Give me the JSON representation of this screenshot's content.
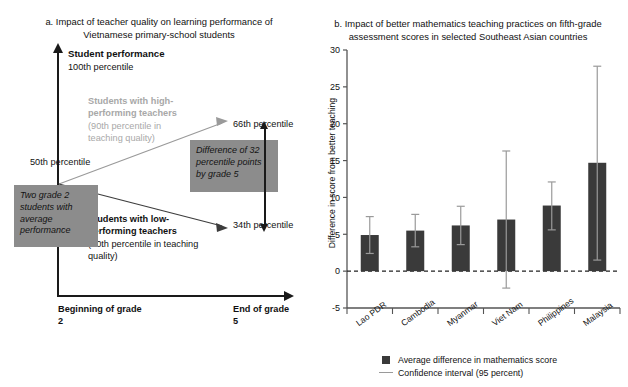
{
  "panel_a": {
    "title": "a. Impact of teacher quality on learning performance of Vietnamese primary-school students",
    "y_axis_title": "Student performance",
    "y_top_label": "100th percentile",
    "y_mid_label": "50th percentile",
    "high_label": "Students with high-performing teachers (90th percentile in teaching quality)",
    "high_label_bold": "Students with high-",
    "high_label_bold2": "performing teachers",
    "high_label_sub": "(90th percentile in teaching quality)",
    "low_label_bold": "Students with low-",
    "low_label_bold2": "performing teachers",
    "low_label_sub": "(10th percentile in teaching quality)",
    "end_high_label": "66th percentile",
    "end_low_label": "34th percentile",
    "x_start_label": "Beginning of grade 2",
    "x_end_label": "End of grade 5",
    "callout_difference": "Difference of 32 percentile points by grade 5",
    "callout_start": "Two grade 2 students with average performance",
    "colors": {
      "axis": "#1a1a1a",
      "grey_box": "#8c8c8c",
      "grey_text": "#a8a8a8",
      "high_line": "#9a9a9a",
      "low_line": "#444444"
    }
  },
  "panel_b": {
    "title": "b. Impact of better mathematics teaching practices on fifth-grade assessment scores in selected Southeast Asian countries",
    "legend": {
      "bar": "Average difference in mathematics score",
      "line": "Confidence interval (95 percent)"
    },
    "colors": {
      "bar": "#3a3a3a",
      "ci": "#9a9a9a",
      "axis": "#555555"
    }
  },
  "chart_data": {
    "type": "bar",
    "title": "b. Impact of better mathematics teaching practices on fifth-grade assessment scores in selected Southeast Asian countries",
    "xlabel": "",
    "ylabel": "Difference in score from better teaching",
    "categories": [
      "Lao PDR",
      "Cambodia",
      "Myanmar",
      "Viet Nam",
      "Philippines",
      "Malaysia"
    ],
    "values": [
      4.9,
      5.5,
      6.2,
      7.0,
      8.9,
      14.7
    ],
    "error_low": [
      2.4,
      3.3,
      3.6,
      -2.3,
      5.6,
      1.5
    ],
    "error_high": [
      7.4,
      7.7,
      8.8,
      16.3,
      12.1,
      27.8
    ],
    "ylim": [
      -5,
      30
    ],
    "yticks": [
      -5,
      0,
      5,
      10,
      15,
      20,
      25,
      30
    ],
    "ytick_labels": [
      "-5",
      "0",
      "5",
      "10",
      "15",
      "20",
      "25",
      "30"
    ],
    "grid": false,
    "zero_line": true,
    "legend": [
      "Average difference in mathematics score",
      "Confidence interval (95 percent)"
    ],
    "legend_position": "bottom",
    "series": [
      {
        "name": "Average difference in mathematics score",
        "values": [
          4.9,
          5.5,
          6.2,
          7.0,
          8.9,
          14.7
        ]
      }
    ]
  }
}
